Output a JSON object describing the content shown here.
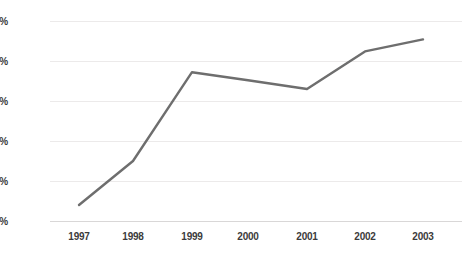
{
  "chart_data": {
    "type": "line",
    "title": "",
    "subtitle": "",
    "xlabel": "",
    "ylabel": "",
    "categories": [
      "1997",
      "1998",
      "1999",
      "2000",
      "2001",
      "2002",
      "2003"
    ],
    "x": [
      1997,
      1998,
      1999,
      2000,
      2001,
      2002,
      2003
    ],
    "series": [
      {
        "name": "",
        "values": [
          0.2,
          0.75,
          1.86,
          1.76,
          1.65,
          2.12,
          2.27
        ],
        "color": "#6e6e6e"
      }
    ],
    "ylim": [
      0.0,
      2.5
    ],
    "ytick_values": [
      0.0,
      0.5,
      1.0,
      1.5,
      2.0,
      2.5
    ],
    "ytick_labels": [
      "0,0%",
      "0,5%",
      "1,0%",
      "1,5%",
      "2,0%",
      "2,5%"
    ],
    "xtick_labels": [
      "1997",
      "1998",
      "1999",
      "2000",
      "2001",
      "2002",
      "2003"
    ],
    "grid": true,
    "grid_axis": "y",
    "grid_color": "#eceaea",
    "axis_color": "#d9d7d7",
    "legend": false,
    "legend_position": "none",
    "markers": false,
    "line_width": 2.4,
    "background_color": "#ffffff",
    "text_color": "#3b3b3b",
    "annotations": []
  }
}
